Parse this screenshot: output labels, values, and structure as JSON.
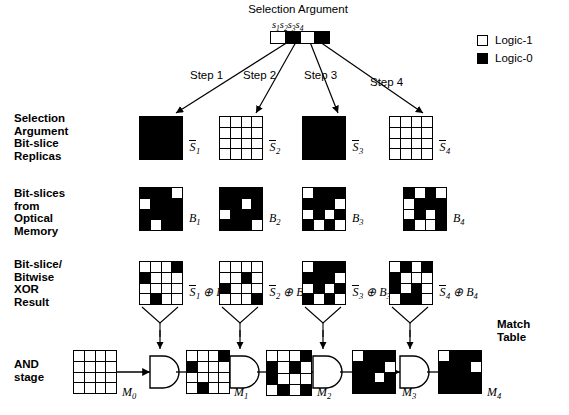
{
  "figure": {
    "title": "Selection Argument",
    "selection_bits_label": "s1s2s3s4",
    "selection_argument": {
      "bit_names": [
        "s",
        "s",
        "s",
        "s"
      ],
      "bit_indices": [
        "1",
        "2",
        "3",
        "4"
      ],
      "values": [
        "Logic-1",
        "Logic-0",
        "Logic-1",
        "Logic-0"
      ],
      "cells": [
        1,
        0,
        1,
        0
      ]
    }
  },
  "legend": {
    "items": [
      {
        "label": "Logic-1",
        "swatch": "white",
        "color": "#ffffff"
      },
      {
        "label": "Logic-0",
        "swatch": "black",
        "color": "#000000"
      }
    ]
  },
  "steps": [
    {
      "label": "Step 1"
    },
    {
      "label": "Step 2"
    },
    {
      "label": "Step 3"
    },
    {
      "label": "Step 4"
    }
  ],
  "row_labels": {
    "replicas": "Selection\nArgument\nBit-slice\nReplicas",
    "bitslices": "Bit-slices\nfrom\nOptical\nMemory",
    "xor": "Bit-slice/\nBitwise\nXOR\nResult",
    "and": "AND\nstage"
  },
  "match_table_label": "Match\nTable",
  "replicas": [
    {
      "name": "S1bar",
      "base": "S",
      "index": "1",
      "overline": true,
      "cells": [
        [
          0,
          0,
          0,
          0
        ],
        [
          0,
          0,
          0,
          0
        ],
        [
          0,
          0,
          0,
          0
        ],
        [
          0,
          0,
          0,
          0
        ]
      ]
    },
    {
      "name": "S2bar",
      "base": "S",
      "index": "2",
      "overline": true,
      "cells": [
        [
          1,
          1,
          1,
          1
        ],
        [
          1,
          1,
          1,
          1
        ],
        [
          1,
          1,
          1,
          1
        ],
        [
          1,
          1,
          1,
          1
        ]
      ]
    },
    {
      "name": "S3bar",
      "base": "S",
      "index": "3",
      "overline": true,
      "cells": [
        [
          0,
          0,
          0,
          0
        ],
        [
          0,
          0,
          0,
          0
        ],
        [
          0,
          0,
          0,
          0
        ],
        [
          0,
          0,
          0,
          0
        ]
      ]
    },
    {
      "name": "S4bar",
      "base": "S",
      "index": "4",
      "overline": true,
      "cells": [
        [
          1,
          1,
          1,
          1
        ],
        [
          1,
          1,
          1,
          1
        ],
        [
          1,
          1,
          1,
          1
        ],
        [
          1,
          1,
          1,
          1
        ]
      ]
    }
  ],
  "bitslices": [
    {
      "name": "B1",
      "base": "B",
      "index": "1",
      "cells": [
        [
          0,
          0,
          0,
          1
        ],
        [
          1,
          0,
          0,
          0
        ],
        [
          0,
          0,
          0,
          0
        ],
        [
          0,
          1,
          0,
          0
        ]
      ]
    },
    {
      "name": "B2",
      "base": "B",
      "index": "2",
      "cells": [
        [
          0,
          0,
          0,
          0
        ],
        [
          0,
          0,
          1,
          0
        ],
        [
          1,
          0,
          0,
          0
        ],
        [
          0,
          0,
          0,
          1
        ]
      ]
    },
    {
      "name": "B3",
      "base": "B",
      "index": "3",
      "cells": [
        [
          1,
          0,
          0,
          0
        ],
        [
          0,
          0,
          0,
          1
        ],
        [
          1,
          0,
          1,
          0
        ],
        [
          0,
          1,
          0,
          1
        ]
      ]
    },
    {
      "name": "B4",
      "base": "B",
      "index": "4",
      "cells": [
        [
          0,
          1,
          0,
          1
        ],
        [
          1,
          0,
          0,
          0
        ],
        [
          1,
          0,
          1,
          0
        ],
        [
          0,
          1,
          1,
          0
        ]
      ]
    }
  ],
  "xor_results": [
    {
      "name": "S1bar-xor-B1",
      "expr": {
        "left_base": "S",
        "left_index": "1",
        "op": "⊕",
        "right_base": "B",
        "right_index": "1"
      },
      "cells": [
        [
          1,
          1,
          1,
          0
        ],
        [
          0,
          1,
          1,
          1
        ],
        [
          1,
          1,
          1,
          1
        ],
        [
          1,
          0,
          1,
          1
        ]
      ]
    },
    {
      "name": "S2bar-xor-B2",
      "expr": {
        "left_base": "S",
        "left_index": "2",
        "op": "⊕",
        "right_base": "B",
        "right_index": "2"
      },
      "cells": [
        [
          1,
          1,
          1,
          1
        ],
        [
          1,
          1,
          0,
          1
        ],
        [
          0,
          1,
          1,
          1
        ],
        [
          1,
          1,
          1,
          0
        ]
      ]
    },
    {
      "name": "S3bar-xor-B3",
      "expr": {
        "left_base": "S",
        "left_index": "3",
        "op": "⊕",
        "right_base": "B",
        "right_index": "3"
      },
      "cells": [
        [
          1,
          0,
          0,
          0
        ],
        [
          0,
          0,
          0,
          1
        ],
        [
          1,
          0,
          1,
          0
        ],
        [
          0,
          1,
          0,
          1
        ]
      ]
    },
    {
      "name": "S4bar-xor-B4",
      "expr": {
        "left_base": "S",
        "left_index": "4",
        "op": "⊕",
        "right_base": "B",
        "right_index": "4"
      },
      "cells": [
        [
          1,
          0,
          1,
          0
        ],
        [
          0,
          1,
          1,
          1
        ],
        [
          0,
          1,
          0,
          1
        ],
        [
          1,
          0,
          0,
          1
        ]
      ]
    }
  ],
  "and_stage": {
    "gates": 4,
    "matches": [
      {
        "name": "M0",
        "base": "M",
        "index": "0",
        "cells": [
          [
            1,
            1,
            1,
            1
          ],
          [
            1,
            1,
            1,
            1
          ],
          [
            1,
            1,
            1,
            1
          ],
          [
            1,
            1,
            1,
            1
          ]
        ]
      },
      {
        "name": "M1",
        "base": "M",
        "index": "1",
        "cells": [
          [
            1,
            1,
            1,
            0
          ],
          [
            0,
            1,
            1,
            1
          ],
          [
            1,
            1,
            1,
            1
          ],
          [
            1,
            0,
            1,
            1
          ]
        ]
      },
      {
        "name": "M2",
        "base": "M",
        "index": "2",
        "cells": [
          [
            1,
            1,
            1,
            0
          ],
          [
            0,
            1,
            0,
            1
          ],
          [
            0,
            1,
            1,
            1
          ],
          [
            1,
            0,
            1,
            0
          ]
        ]
      },
      {
        "name": "M3",
        "base": "M",
        "index": "3",
        "cells": [
          [
            1,
            0,
            0,
            0
          ],
          [
            0,
            0,
            0,
            1
          ],
          [
            0,
            0,
            1,
            0
          ],
          [
            0,
            0,
            0,
            0
          ]
        ]
      },
      {
        "name": "M4",
        "base": "M",
        "index": "4",
        "cells": [
          [
            1,
            0,
            0,
            0
          ],
          [
            0,
            0,
            0,
            1
          ],
          [
            0,
            0,
            0,
            0
          ],
          [
            0,
            0,
            0,
            0
          ]
        ]
      }
    ]
  }
}
